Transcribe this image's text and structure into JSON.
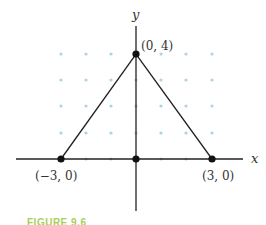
{
  "diagram": {
    "type": "coordinate-plane-triangle",
    "axes": {
      "x_label": "x",
      "y_label": "y"
    },
    "points": [
      {
        "label": "(−3, 0)",
        "x": -3,
        "y": 0
      },
      {
        "label": "(0, 4)",
        "x": 0,
        "y": 4
      },
      {
        "label": "(3, 0)",
        "x": 3,
        "y": 0
      },
      {
        "label": "",
        "x": 0,
        "y": 0
      }
    ],
    "grid": {
      "x_range": [
        -3,
        3
      ],
      "y_range": [
        0,
        4
      ],
      "dot_color": "#a8d4ec"
    },
    "line_color": "#222222"
  },
  "caption": "FIGURE 9.6",
  "colors": {
    "caption": "#a9cf55"
  }
}
